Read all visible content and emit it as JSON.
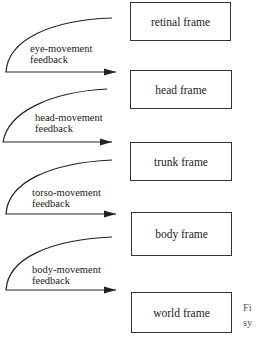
{
  "frames": [
    {
      "label": "retinal frame"
    },
    {
      "label": "head frame"
    },
    {
      "label": "trunk frame"
    },
    {
      "label": "body frame"
    },
    {
      "label": "world frame"
    }
  ],
  "feedbacks": [
    {
      "line1": "eye-movement",
      "line2": "feedback"
    },
    {
      "line1": "head-movement",
      "line2": "feedback"
    },
    {
      "line1": "torso-movement",
      "line2": "feedback"
    },
    {
      "line1": "body-movement",
      "line2": "feedback"
    }
  ],
  "caption": {
    "line1": "Fi",
    "line2": "sy"
  }
}
